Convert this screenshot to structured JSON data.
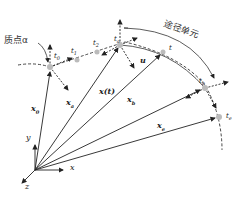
{
  "diagram": {
    "title_labels": {
      "particle": "质点α",
      "path_element": "途径单元"
    },
    "points": [
      {
        "id": "t0",
        "label": "t",
        "sub": "0"
      },
      {
        "id": "t1",
        "label": "t",
        "sub": "1"
      },
      {
        "id": "t2",
        "label": "t",
        "sub": "2"
      },
      {
        "id": "ta",
        "label": "t",
        "sub": "a"
      },
      {
        "id": "t",
        "label": "t",
        "sub": ""
      },
      {
        "id": "tb",
        "label": "t",
        "sub": "b"
      },
      {
        "id": "te",
        "label": "t",
        "sub": "e"
      }
    ],
    "vectors": [
      {
        "id": "x0",
        "label": "x",
        "sub": "0"
      },
      {
        "id": "xa_upper",
        "label": "x",
        "sub": "a"
      },
      {
        "id": "xt",
        "label": "x(t)",
        "sub": ""
      },
      {
        "id": "xb",
        "label": "x",
        "sub": "b"
      },
      {
        "id": "xe",
        "label": "x",
        "sub": "e"
      }
    ],
    "velocity_label": "u",
    "axes": {
      "x": "x",
      "y": "y",
      "z": "z"
    }
  }
}
